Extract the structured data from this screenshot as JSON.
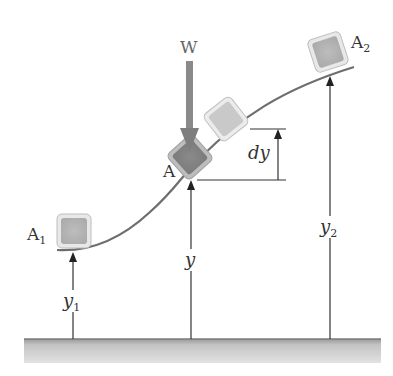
{
  "diagram": {
    "title": "",
    "labels": {
      "weight": "W",
      "point_A": "A",
      "point_A1": "A",
      "point_A1_sub": "1",
      "point_A2": "A",
      "point_A2_sub": "2",
      "dy": "dy",
      "y": "y",
      "y1": "y",
      "y1_sub": "1",
      "y2": "y",
      "y2_sub": "2"
    },
    "colors": {
      "curve": "#6e6e6e",
      "arrow_W": "#8a8a8a",
      "block_fill": "#c8c8c8",
      "block_dark_fill": "#8c8c8c",
      "ground": "#bfbfbf",
      "lines": "#222222"
    }
  }
}
